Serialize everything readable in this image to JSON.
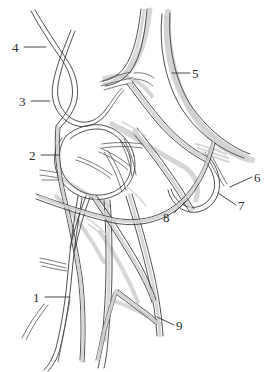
{
  "figure": {
    "type": "anatomical-line-drawing",
    "background_color": "#ffffff",
    "line_color": "#3a3a3a",
    "shade_color": "#cfcfcf",
    "label_color": "#2b2b2b",
    "width": 273,
    "height": 372
  },
  "labels": [
    {
      "id": "label-1",
      "text": "1",
      "x": 33,
      "y": 291,
      "leader": {
        "x1": 45,
        "y1": 297,
        "x2": 70,
        "y2": 297
      }
    },
    {
      "id": "label-2",
      "text": "2",
      "x": 29,
      "y": 149,
      "leader": {
        "x1": 41,
        "y1": 155,
        "x2": 60,
        "y2": 155
      }
    },
    {
      "id": "label-3",
      "text": "3",
      "x": 19,
      "y": 95,
      "leader": {
        "x1": 31,
        "y1": 101,
        "x2": 50,
        "y2": 101
      }
    },
    {
      "id": "label-4",
      "text": "4",
      "x": 12,
      "y": 41,
      "leader": {
        "x1": 24,
        "y1": 47,
        "x2": 46,
        "y2": 47
      }
    },
    {
      "id": "label-5",
      "text": "5",
      "x": 192,
      "y": 67,
      "leader": {
        "x1": 172,
        "y1": 73,
        "x2": 190,
        "y2": 73
      }
    },
    {
      "id": "label-6",
      "text": "6",
      "x": 254,
      "y": 171,
      "leader": {
        "x1": 230,
        "y1": 187,
        "x2": 252,
        "y2": 177
      }
    },
    {
      "id": "label-7",
      "text": "7",
      "x": 238,
      "y": 199,
      "leader": {
        "x1": 218,
        "y1": 193,
        "x2": 236,
        "y2": 205
      }
    },
    {
      "id": "label-8",
      "text": "8",
      "x": 163,
      "y": 211,
      "leader": {
        "x1": 174,
        "y1": 213,
        "x2": 186,
        "y2": 201
      }
    },
    {
      "id": "label-9",
      "text": "9",
      "x": 176,
      "y": 319,
      "leader": {
        "x1": 157,
        "y1": 317,
        "x2": 174,
        "y2": 325
      }
    }
  ],
  "structures": [
    {
      "id": "trunk-left-outer",
      "name": "left lateral descending trunk"
    },
    {
      "id": "trunk-left-inner",
      "name": "left medial descending trunk"
    },
    {
      "id": "trunk-upper-midline",
      "name": "upper midline ascending trunk"
    },
    {
      "id": "trunk-upper-right",
      "name": "upper right lateral trunk"
    },
    {
      "id": "loop-medial",
      "name": "medial anastomotic loop"
    },
    {
      "id": "loop-lateral",
      "name": "lateral descending loop"
    },
    {
      "id": "branch-plexus-center",
      "name": "central plexus convergence"
    },
    {
      "id": "branch-lower-left",
      "name": "lower left bifurcation"
    },
    {
      "id": "branch-lower-right",
      "name": "lower right bifurcation"
    },
    {
      "id": "cut-ends-left",
      "name": "left cut branch stubs"
    }
  ]
}
